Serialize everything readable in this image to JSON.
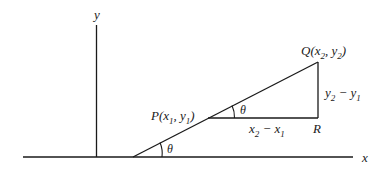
{
  "diagram": {
    "type": "slope-angle-diagram",
    "axes": {
      "x_label": "x",
      "y_label": "y"
    },
    "points": {
      "P": {
        "name": "P",
        "label_prefix": "P(x",
        "sub1": "1",
        "mid": ", y",
        "sub2": "1",
        "suffix": ")"
      },
      "Q": {
        "name": "Q",
        "label_prefix": "Q(x",
        "sub1": "2",
        "mid": ", y",
        "sub2": "2",
        "suffix": ")"
      },
      "R": {
        "name": "R",
        "label": "R"
      }
    },
    "segments": {
      "horizontal": {
        "a": "x",
        "a_sub": "2",
        "op": " − x",
        "b_sub": "1"
      },
      "vertical": {
        "a": "y",
        "a_sub": "2",
        "op": " − y",
        "b_sub": "1"
      }
    },
    "angles": {
      "at_x_axis": "θ",
      "at_P": "θ"
    },
    "colors": {
      "line": "#1a1a1a",
      "background": "#ffffff"
    }
  }
}
